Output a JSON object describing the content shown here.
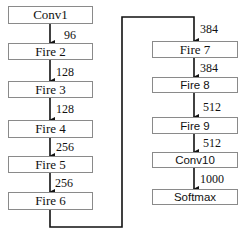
{
  "diagram": {
    "left_column": [
      {
        "label": "Conv1"
      },
      {
        "label": "Fire 2"
      },
      {
        "label": "Fire 3"
      },
      {
        "label": "Fire 4"
      },
      {
        "label": "Fire 5"
      },
      {
        "label": "Fire 6"
      }
    ],
    "right_column": [
      {
        "label": "Fire 7"
      },
      {
        "label": "Fire 8"
      },
      {
        "label": "Fire 9"
      },
      {
        "label": "Conv10"
      },
      {
        "label": "Softmax"
      }
    ],
    "edges": [
      {
        "from": "Conv1",
        "to": "Fire 2",
        "label": "96"
      },
      {
        "from": "Fire 2",
        "to": "Fire 3",
        "label": "128"
      },
      {
        "from": "Fire 3",
        "to": "Fire 4",
        "label": "128"
      },
      {
        "from": "Fire 4",
        "to": "Fire 5",
        "label": "256"
      },
      {
        "from": "Fire 5",
        "to": "Fire 6",
        "label": "256"
      },
      {
        "from": "Fire 6",
        "to": "Fire 7",
        "label": "384"
      },
      {
        "from": "Fire 7",
        "to": "Fire 8",
        "label": "384"
      },
      {
        "from": "Fire 8",
        "to": "Fire 9",
        "label": "512"
      },
      {
        "from": "Fire 9",
        "to": "Conv10",
        "label": "512"
      },
      {
        "from": "Conv10",
        "to": "Softmax",
        "label": "1000"
      }
    ],
    "colors": {
      "box_border": "#8a8a8a",
      "line": "#111111",
      "background": "#ffffff"
    }
  }
}
